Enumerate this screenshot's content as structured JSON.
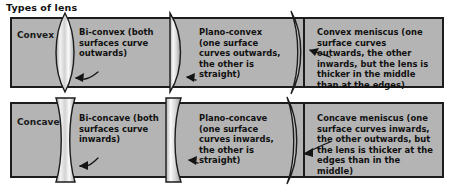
{
  "figure": {
    "title": "Types of lens",
    "background_color": "#ffffff",
    "bar_fill_color": "#b4b4b4",
    "border_color": "#1c1c1c",
    "lens_fill_color": "#e8e8e8"
  },
  "rows": [
    {
      "id": "convex",
      "label": "Convex",
      "lenses": [
        {
          "name": "bi-convex",
          "shape": "bi-convex",
          "caption": "Bi-convex (both surfaces curve outwards)"
        },
        {
          "name": "plano-convex",
          "shape": "plano-convex",
          "caption": "Plano-convex (one surface curves outwards, the other is straight)"
        },
        {
          "name": "convex-meniscus",
          "shape": "convex-meniscus",
          "caption": "Convex meniscus (one surface curves outwards, the other inwards, but the lens is thicker in the middle than at the edges)"
        }
      ]
    },
    {
      "id": "concave",
      "label": "Concave",
      "lenses": [
        {
          "name": "bi-concave",
          "shape": "bi-concave",
          "caption": "Bi-concave (both surfaces curve inwards)"
        },
        {
          "name": "plano-concave",
          "shape": "plano-concave",
          "caption": "Plano-concave (one surface curves inwards, the other is straight)"
        },
        {
          "name": "concave-meniscus",
          "shape": "concave-meniscus",
          "caption": "Concave meniscus (one surface curves inwards, the other outwards, but the lens is thicker at the edges than in the middle)"
        }
      ]
    }
  ]
}
